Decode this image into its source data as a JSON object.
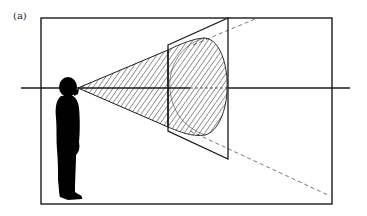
{
  "figure": {
    "panel_label": "(a)"
  },
  "colors": {
    "stroke": "#1a1a1a",
    "silhouette": "#000000",
    "hatch": "#222222",
    "dashed": "#555555",
    "background": "#ffffff"
  },
  "elements": {
    "outer_frame": "rectangle",
    "picture_plane": "trapezoid (perspective quad)",
    "view_cone": "hatched cone from eye",
    "projected_disc": "hatched ellipse on picture plane",
    "sight_axis": "horizontal line through eye",
    "projection_lines": "dashed lines from plane corners to frame"
  }
}
